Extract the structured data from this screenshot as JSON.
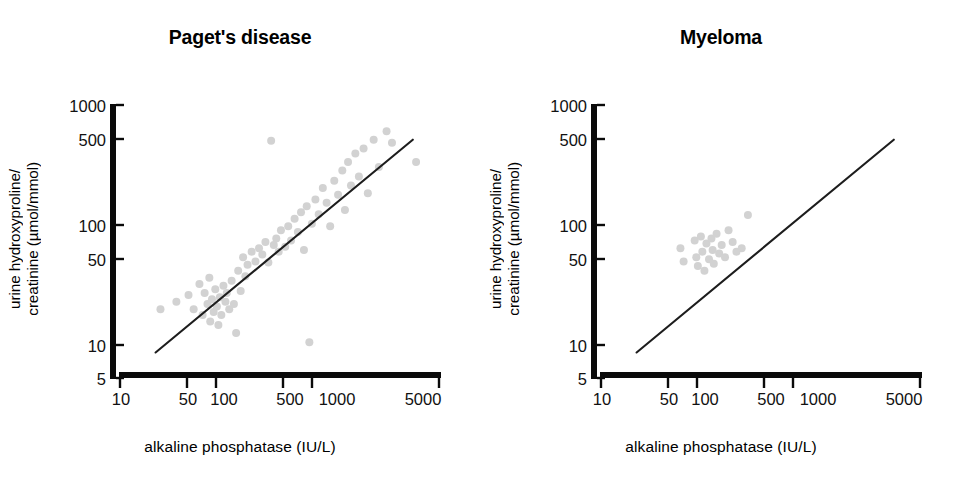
{
  "figure": {
    "background": "#ffffff",
    "point_color": "#d2d2d2",
    "axis_color": "#0a0a0a",
    "line_color": "#1d1d1d",
    "width": 961,
    "height": 488
  },
  "panels": [
    {
      "id": "paget",
      "title": "Paget's disease",
      "y_axis_label_line1": "urine hydroxyproline/",
      "y_axis_label_line2": "creatinine (µmol/mmol)",
      "x_axis_label": "alkaline phosphatase  (IU/L)",
      "y_ticks": [
        "1000",
        "500",
        "100",
        "50",
        "10",
        "5"
      ],
      "x_ticks": [
        "10",
        "50",
        "100",
        "500",
        "1000",
        "5000"
      ]
    },
    {
      "id": "myeloma",
      "title": "Myeloma",
      "y_axis_label_line1": "urine hydroxyproline/",
      "y_axis_label_line2": "creatinine (µmol/mmol)",
      "x_axis_label": "alkaline phosphatase  (IU/L)",
      "y_ticks": [
        "1000",
        "500",
        "100",
        "50",
        "10",
        "5"
      ],
      "x_ticks": [
        "10",
        "50",
        "100",
        "500",
        "1000",
        "5000"
      ]
    }
  ],
  "chart_data": [
    {
      "type": "scatter",
      "title": "Paget's disease",
      "xlabel": "alkaline phosphatase  (IU/L)",
      "ylabel": "urine hydroxyproline/creatinine (µmol/mmol)",
      "xscale": "log",
      "yscale": "log",
      "xlim": [
        10,
        5000
      ],
      "ylim": [
        5,
        1000
      ],
      "xticks": [
        10,
        50,
        100,
        500,
        1000,
        5000
      ],
      "yticks": [
        5,
        10,
        50,
        100,
        500,
        1000
      ],
      "grid": false,
      "legend": "none",
      "marker_color": "#d2d2d2",
      "trend_line": {
        "label": "regression line",
        "x_start": 20,
        "y_start": 8.2,
        "x_end": 3000,
        "y_end": 510
      },
      "points": [
        [
          22,
          19
        ],
        [
          30,
          22
        ],
        [
          38,
          25
        ],
        [
          42,
          19
        ],
        [
          47,
          31
        ],
        [
          50,
          17
        ],
        [
          52,
          26
        ],
        [
          55,
          21
        ],
        [
          57,
          35
        ],
        [
          58,
          15
        ],
        [
          60,
          23
        ],
        [
          62,
          18
        ],
        [
          64,
          28
        ],
        [
          66,
          20
        ],
        [
          68,
          14
        ],
        [
          70,
          24
        ],
        [
          72,
          17
        ],
        [
          75,
          30
        ],
        [
          78,
          22
        ],
        [
          80,
          26
        ],
        [
          84,
          19
        ],
        [
          88,
          33
        ],
        [
          92,
          21
        ],
        [
          96,
          12
        ],
        [
          100,
          40
        ],
        [
          105,
          27
        ],
        [
          110,
          52
        ],
        [
          115,
          36
        ],
        [
          120,
          45
        ],
        [
          130,
          58
        ],
        [
          140,
          48
        ],
        [
          150,
          62
        ],
        [
          160,
          55
        ],
        [
          170,
          70
        ],
        [
          180,
          47
        ],
        [
          190,
          500
        ],
        [
          200,
          66
        ],
        [
          210,
          75
        ],
        [
          220,
          58
        ],
        [
          230,
          88
        ],
        [
          250,
          64
        ],
        [
          265,
          95
        ],
        [
          280,
          72
        ],
        [
          300,
          110
        ],
        [
          320,
          85
        ],
        [
          340,
          125
        ],
        [
          360,
          60
        ],
        [
          380,
          140
        ],
        [
          400,
          10
        ],
        [
          420,
          100
        ],
        [
          450,
          160
        ],
        [
          480,
          120
        ],
        [
          520,
          200
        ],
        [
          560,
          150
        ],
        [
          600,
          95
        ],
        [
          650,
          230
        ],
        [
          700,
          175
        ],
        [
          760,
          280
        ],
        [
          800,
          130
        ],
        [
          850,
          330
        ],
        [
          900,
          210
        ],
        [
          980,
          390
        ],
        [
          1050,
          250
        ],
        [
          1150,
          430
        ],
        [
          1250,
          180
        ],
        [
          1400,
          510
        ],
        [
          1550,
          300
        ],
        [
          1800,
          600
        ],
        [
          2000,
          480
        ],
        [
          3200,
          330
        ]
      ]
    },
    {
      "type": "scatter",
      "title": "Myeloma",
      "xlabel": "alkaline phosphatase  (IU/L)",
      "ylabel": "urine hydroxyproline/creatinine (µmol/mmol)",
      "xscale": "log",
      "yscale": "log",
      "xlim": [
        10,
        5000
      ],
      "ylim": [
        5,
        1000
      ],
      "xticks": [
        10,
        50,
        100,
        500,
        1000,
        5000
      ],
      "yticks": [
        5,
        10,
        50,
        100,
        500,
        1000
      ],
      "grid": false,
      "legend": "none",
      "marker_color": "#d2d2d2",
      "trend_line": {
        "label": "reference line",
        "x_start": 20,
        "y_start": 8.2,
        "x_end": 3000,
        "y_end": 510
      },
      "points": [
        [
          47,
          62
        ],
        [
          50,
          48
        ],
        [
          62,
          72
        ],
        [
          64,
          52
        ],
        [
          66,
          44
        ],
        [
          70,
          78
        ],
        [
          72,
          58
        ],
        [
          75,
          40
        ],
        [
          78,
          68
        ],
        [
          82,
          50
        ],
        [
          86,
          75
        ],
        [
          88,
          60
        ],
        [
          90,
          46
        ],
        [
          95,
          82
        ],
        [
          100,
          56
        ],
        [
          105,
          66
        ],
        [
          112,
          52
        ],
        [
          120,
          88
        ],
        [
          130,
          70
        ],
        [
          140,
          58
        ],
        [
          155,
          62
        ],
        [
          175,
          118
        ]
      ]
    }
  ]
}
